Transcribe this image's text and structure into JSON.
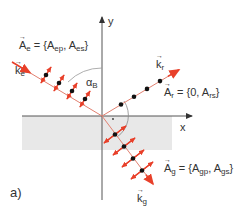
{
  "figure": {
    "panel_label": "a)",
    "axes": {
      "x_label": "x",
      "y_label": "y"
    },
    "angle_label": {
      "symbol": "α",
      "sub": "B"
    },
    "incident": {
      "k_label": {
        "main": "k",
        "sub": "e"
      },
      "A_label": {
        "main": "A",
        "sub": "e",
        "eq": " = {A",
        "s1": "ep",
        "mid": ", A",
        "s2": "es",
        "end": "}"
      }
    },
    "reflected": {
      "k_label": {
        "main": "k",
        "sub": "r"
      },
      "A_label": {
        "main": "A",
        "sub": "r",
        "eq": " = {0, A",
        "s1": "rs",
        "end": "}"
      }
    },
    "refracted": {
      "k_label": {
        "main": "k",
        "sub": "g"
      },
      "A_label": {
        "main": "A",
        "sub": "g",
        "eq": " = {A",
        "s1": "gp",
        "mid": ", A",
        "s2": "gs",
        "end": "}"
      }
    },
    "colors": {
      "ray": "#e8402a",
      "ray_line": "#e07060",
      "dot": "#111111",
      "axis": "#444444",
      "medium": "#e6e6e6",
      "arc": "#888888"
    }
  }
}
